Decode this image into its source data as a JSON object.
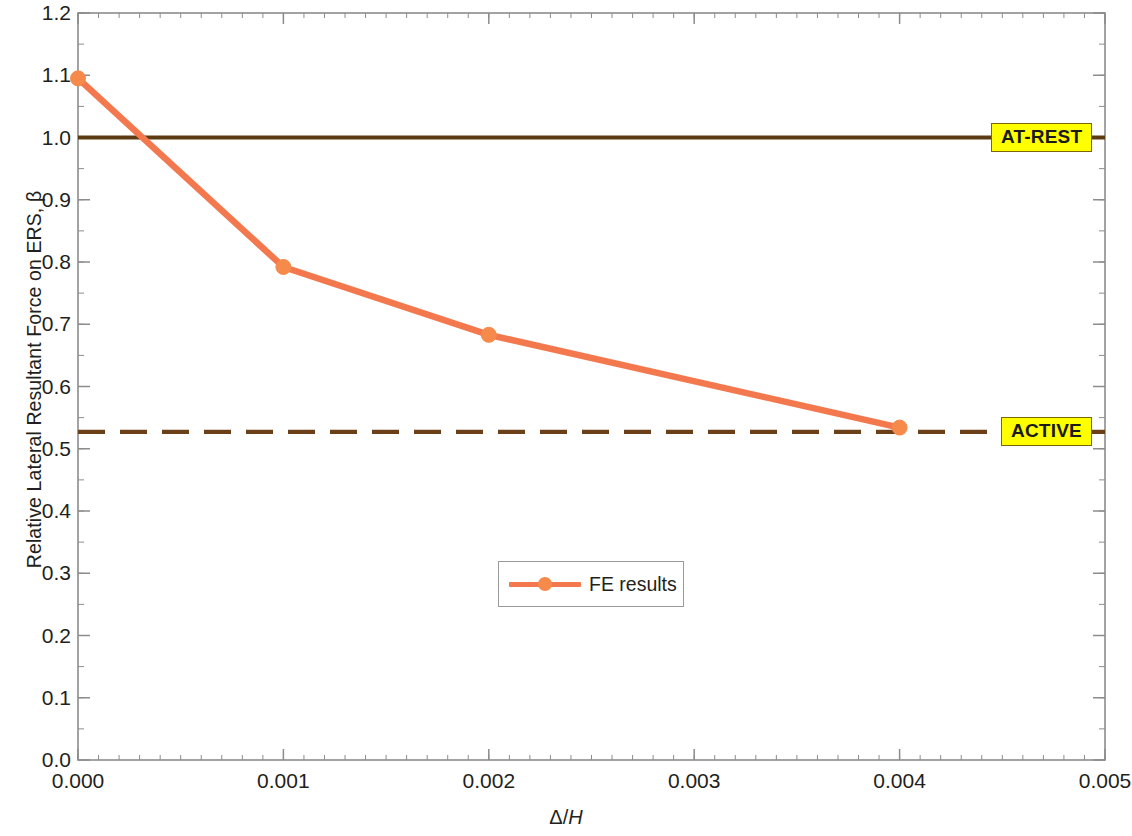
{
  "chart_data": {
    "type": "line",
    "title": "",
    "xlabel": "Δ/H",
    "xlabel_symbol": "Δ/",
    "xlabel_italic": "H",
    "ylabel": "Relative Lateral Resultant Force on ERS, β",
    "xlim": [
      0.0,
      0.005
    ],
    "ylim": [
      0.0,
      1.2
    ],
    "xticks": [
      0.0,
      0.001,
      0.002,
      0.003,
      0.004,
      0.005
    ],
    "xtick_labels": [
      "0.000",
      "0.001",
      "0.002",
      "0.003",
      "0.004",
      "0.005"
    ],
    "x_minor_step": 0.0001,
    "yticks": [
      0.0,
      0.1,
      0.2,
      0.3,
      0.4,
      0.5,
      0.6,
      0.7,
      0.8,
      0.9,
      1.0,
      1.1,
      1.2
    ],
    "ytick_labels": [
      "0.0",
      "0.1",
      "0.2",
      "0.3",
      "0.4",
      "0.5",
      "0.6",
      "0.7",
      "0.8",
      "0.9",
      "1.0",
      "1.1",
      "1.2"
    ],
    "y_minor_step": 0.05,
    "grid": false,
    "legend_position": "center",
    "series": [
      {
        "name": "FE results",
        "style": "line-marker",
        "color": "#F4784E",
        "marker_color": "#F58A4B",
        "x": [
          0.0,
          0.001,
          0.002,
          0.004
        ],
        "values": [
          1.095,
          0.792,
          0.683,
          0.534
        ]
      }
    ],
    "reference_lines": [
      {
        "label": "AT-REST",
        "value": 1.0,
        "style": "solid",
        "color": "#5C3A12"
      },
      {
        "label": "ACTIVE",
        "value": 0.527,
        "style": "dashed",
        "color": "#6B3F18"
      }
    ],
    "annotations": [
      {
        "text": "AT-REST",
        "x": 0.0047,
        "y": 1.0,
        "box_fill": "#ffff00",
        "box_border": "#7d6608"
      },
      {
        "text": "ACTIVE",
        "x": 0.0047,
        "y": 0.527,
        "box_fill": "#ffff00",
        "box_border": "#7d6608"
      }
    ],
    "axis_color": "#8c8c8c",
    "text_color": "#231f20"
  },
  "legend": {
    "entries": [
      {
        "label": "FE results"
      }
    ]
  }
}
